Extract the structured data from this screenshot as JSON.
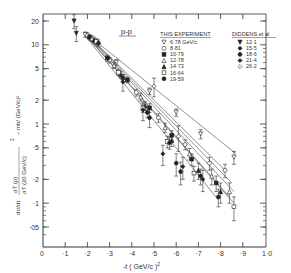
{
  "chart_data": {
    "type": "scatter",
    "title": "",
    "panel_label": "p-p",
    "xlabel": "-t ( GeV/c )²",
    "ylabel": "dσ/dt / (σT(p)/σT(20 GeV/c))² – mb/(GeV/c)²",
    "ylabel_parts": {
      "lhs": "dσ/dt",
      "ratio_num": "σT (p)",
      "ratio_den": "σT (20 GeV/c)",
      "power": "2",
      "units": "– mb/ (GeV/c)²"
    },
    "xlim": [
      0,
      1.0
    ],
    "ylim": [
      0.035,
      25
    ],
    "yscale": "log",
    "x_ticks": [
      "0",
      "·1",
      "·2",
      "·3",
      "·4",
      "·5",
      "·6",
      "·7",
      "·8",
      "·9",
      "1·0"
    ],
    "x_tick_values": [
      0,
      0.1,
      0.2,
      0.3,
      0.4,
      0.5,
      0.6,
      0.7,
      0.8,
      0.9,
      1.0
    ],
    "y_ticks": [
      "20",
      "10",
      "5",
      "2",
      "1",
      "·5",
      "·2",
      "·1",
      "·05"
    ],
    "y_tick_values": [
      20,
      10,
      5,
      2,
      1,
      0.5,
      0.2,
      0.1,
      0.05
    ],
    "grid": false,
    "legend": {
      "position": "upper right",
      "groups": [
        {
          "title": "THIS EXPERIMENT",
          "unit": "GeV/c",
          "entries": [
            {
              "label": "6·78 GeV/c",
              "marker": "triangle-down-open"
            },
            {
              "label": "8·81",
              "marker": "circle-open"
            },
            {
              "label": "10·79",
              "marker": "square-filled"
            },
            {
              "label": "12·78",
              "marker": "triangle-open"
            },
            {
              "label": "14·73",
              "marker": "triangle-filled"
            },
            {
              "label": "16·64",
              "marker": "square-open"
            },
            {
              "label": "19·59",
              "marker": "circle-filled"
            }
          ]
        },
        {
          "title": "DIDDENS et al",
          "entries": [
            {
              "label": "12·1",
              "marker": "triangle-down-filled"
            },
            {
              "label": "15·5",
              "marker": "diamond-filled"
            },
            {
              "label": "18·6",
              "marker": "hexagon-filled"
            },
            {
              "label": "21·4",
              "marker": "diamond-filled-2"
            },
            {
              "label": "26·2",
              "marker": "diamond-open"
            }
          ]
        }
      ]
    },
    "fit_lines": [
      {
        "name": "6·78",
        "x": [
          0.2,
          0.87
        ],
        "y": [
          13.5,
          0.42
        ]
      },
      {
        "name": "8·81",
        "x": [
          0.2,
          0.82
        ],
        "y": [
          13.5,
          0.26
        ]
      },
      {
        "name": "10·79",
        "x": [
          0.2,
          0.85
        ],
        "y": [
          13.3,
          0.18
        ]
      },
      {
        "name": "12·78",
        "x": [
          0.2,
          0.86
        ],
        "y": [
          13.0,
          0.14
        ]
      },
      {
        "name": "14·73",
        "x": [
          0.2,
          0.84
        ],
        "y": [
          12.8,
          0.12
        ]
      },
      {
        "name": "16·64",
        "x": [
          0.2,
          0.86
        ],
        "y": [
          12.5,
          0.1
        ]
      },
      {
        "name": "19·59",
        "x": [
          0.2,
          0.79
        ],
        "y": [
          12.0,
          0.11
        ]
      }
    ],
    "series": [
      {
        "name": "6·78 GeV/c",
        "marker": "triangle-down-open",
        "x": [
          0.19,
          0.33,
          0.48,
          0.6,
          0.71,
          0.86
        ],
        "y": [
          13.5,
          6.0,
          2.6,
          1.4,
          0.75,
          0.38
        ],
        "yerr": [
          1.0,
          0.5,
          0.25,
          0.15,
          0.1,
          0.07
        ]
      },
      {
        "name": "8·81",
        "marker": "circle-open",
        "x": [
          0.2,
          0.3,
          0.42,
          0.52,
          0.64,
          0.75,
          0.82
        ],
        "y": [
          13.2,
          6.4,
          2.5,
          1.2,
          0.55,
          0.32,
          0.26
        ],
        "yerr": [
          1.0,
          0.5,
          0.25,
          0.15,
          0.08,
          0.06,
          0.05
        ]
      },
      {
        "name": "10·79",
        "marker": "square-filled",
        "x": [
          0.21,
          0.29,
          0.38,
          0.48,
          0.58,
          0.67,
          0.78
        ],
        "y": [
          12.5,
          6.8,
          3.6,
          1.6,
          0.72,
          0.36,
          0.18
        ],
        "yerr": [
          1.0,
          0.6,
          0.3,
          0.2,
          0.1,
          0.06,
          0.04
        ]
      },
      {
        "name": "12·78",
        "marker": "triangle-open",
        "x": [
          0.22,
          0.32,
          0.44,
          0.55,
          0.66,
          0.76,
          0.84
        ],
        "y": [
          12.0,
          5.5,
          2.2,
          0.9,
          0.42,
          0.22,
          0.14
        ],
        "yerr": [
          1.0,
          0.5,
          0.25,
          0.12,
          0.07,
          0.05,
          0.04
        ]
      },
      {
        "name": "14·73",
        "marker": "triangle-filled",
        "x": [
          0.23,
          0.35,
          0.46,
          0.58,
          0.7,
          0.8
        ],
        "y": [
          11.5,
          4.2,
          1.7,
          0.62,
          0.26,
          0.14
        ],
        "yerr": [
          1.0,
          0.4,
          0.2,
          0.1,
          0.06,
          0.04
        ]
      },
      {
        "name": "16·64",
        "marker": "square-open",
        "x": [
          0.24,
          0.34,
          0.45,
          0.56,
          0.68,
          0.86
        ],
        "y": [
          11.0,
          4.5,
          1.6,
          0.6,
          0.24,
          0.09
        ],
        "yerr": [
          1.0,
          0.4,
          0.2,
          0.1,
          0.05,
          0.03
        ]
      },
      {
        "name": "19·59",
        "marker": "circle-filled",
        "x": [
          0.25,
          0.36,
          0.47,
          0.57,
          0.71,
          0.79
        ],
        "y": [
          10.5,
          3.8,
          1.4,
          0.58,
          0.22,
          0.12
        ],
        "yerr": [
          1.0,
          0.4,
          0.2,
          0.1,
          0.05,
          0.03
        ]
      },
      {
        "name": "12·1 (Diddens)",
        "marker": "triangle-down-filled",
        "x": [
          0.14,
          0.15
        ],
        "y": [
          20.0,
          14.0
        ],
        "yerr": [
          4.0,
          3.0
        ]
      },
      {
        "name": "15·5 (Diddens)",
        "marker": "diamond-filled",
        "x": [
          0.36,
          0.45,
          0.54
        ],
        "y": [
          3.4,
          1.5,
          0.42
        ],
        "yerr": [
          0.8,
          0.4,
          0.12
        ]
      },
      {
        "name": "18·6 (Diddens)",
        "marker": "hexagon-filled",
        "x": [
          0.48,
          0.6,
          0.62
        ],
        "y": [
          1.2,
          0.32,
          0.25
        ],
        "yerr": [
          0.3,
          0.1,
          0.08
        ]
      },
      {
        "name": "21·4 (Diddens)",
        "marker": "diamond-filled-2",
        "x": [
          0.63,
          0.72
        ],
        "y": [
          0.29,
          0.2
        ],
        "yerr": [
          0.09,
          0.06
        ]
      },
      {
        "name": "26·2 (Diddens)",
        "marker": "diamond-open",
        "x": [
          0.5,
          0.61
        ],
        "y": [
          3.0,
          0.7
        ],
        "yerr": [
          0.8,
          0.25
        ]
      }
    ]
  },
  "axes": {
    "x_title_text": "-t ( GeV/c )",
    "x_title_sup": "2"
  }
}
